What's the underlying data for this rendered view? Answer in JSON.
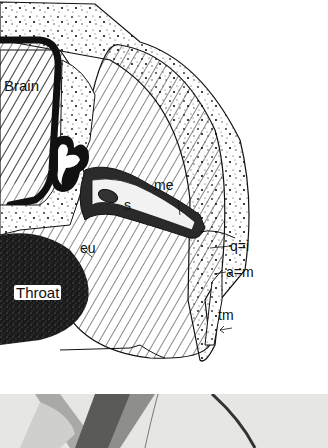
{
  "figure": {
    "type": "anatomical cross-section illustration",
    "labels": {
      "brain": "Brain",
      "throat": "Throat",
      "me": "me",
      "s": "s",
      "eu": "eu",
      "q_i": "q=i",
      "a_m": "a=m",
      "tm": "tm"
    },
    "colors": {
      "ink": "#111111",
      "paper": "#ffffff",
      "photo_bg": "#e6e6e4"
    }
  },
  "photo_strip": {
    "description": "grayscale micrograph strip"
  }
}
